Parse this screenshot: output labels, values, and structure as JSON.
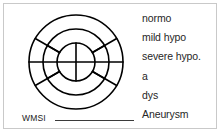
{
  "figure": {
    "background_color": "#ffffff",
    "border_color": "#c9c9c9",
    "ink_color": "#000000"
  },
  "bullseye": {
    "name": "17-segment left ventricle bullseye",
    "center": {
      "x": 54,
      "y": 54
    },
    "rings": [
      {
        "name": "outer-ring",
        "radius": 47
      },
      {
        "name": "middle-ring",
        "radius": 33
      },
      {
        "name": "inner-ring",
        "radius": 19
      }
    ],
    "diameter_line_angle_deg": 0,
    "inner_cross": {
      "vertical": true,
      "horizontal": true
    },
    "spoke_angles_deg": [
      30,
      150,
      210,
      330
    ],
    "stroke_width": 1.6
  },
  "score": {
    "label": "WMSI",
    "value": ""
  },
  "legend": {
    "items": [
      {
        "label": "normo"
      },
      {
        "label": "mild hypo"
      },
      {
        "label": "severe hypo."
      },
      {
        "label": "a"
      },
      {
        "label": "dys"
      },
      {
        "label": "Aneurysm"
      }
    ]
  }
}
